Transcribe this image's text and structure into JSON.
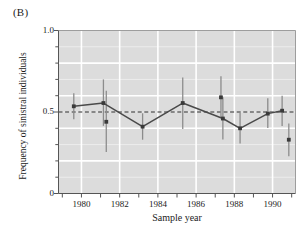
{
  "panel": {
    "label": "(B)"
  },
  "chart_data": {
    "type": "scatter",
    "title": "",
    "xlabel": "Sample year",
    "ylabel": "Frequency of sinistral individuals",
    "xlim": [
      1978.8,
      1991.2
    ],
    "ylim": [
      0.0,
      1.0
    ],
    "grid": true,
    "grid_color": "#ffffff",
    "plot_bg": "#dcdcdc",
    "legend": "none",
    "series_color": "#4a4a4a",
    "marker_color": "#3a3a3a",
    "errorbar_color": "#8c8c8c",
    "xticks_major": [
      1980,
      1982,
      1984,
      1986,
      1988,
      1990
    ],
    "xticks_major_labels": [
      "1980",
      "1982",
      "1984",
      "1986",
      "1988",
      "1990"
    ],
    "xticks_minor": [
      1979,
      1981,
      1983,
      1985,
      1987,
      1989,
      1991
    ],
    "yticks_major": [
      0.0,
      0.5,
      1.0
    ],
    "yticks_major_labels": [
      "0",
      "0.5",
      "1.0"
    ],
    "yticks_minor": [
      0.1,
      0.2,
      0.3,
      0.4,
      0.6,
      0.7,
      0.8,
      0.9
    ],
    "reference_line": {
      "y": 0.5,
      "style": "dashed",
      "color": "#2b2b2b"
    },
    "connected": true,
    "points": [
      {
        "x": 1979.6,
        "y": 0.535,
        "lo": 0.455,
        "hi": 0.615,
        "connect": true
      },
      {
        "x": 1981.15,
        "y": 0.555,
        "lo": 0.415,
        "hi": 0.7,
        "connect": true
      },
      {
        "x": 1983.2,
        "y": 0.41,
        "lo": 0.33,
        "hi": 0.492,
        "connect": true
      },
      {
        "x": 1985.3,
        "y": 0.555,
        "lo": 0.395,
        "hi": 0.712,
        "connect": true
      },
      {
        "x": 1987.4,
        "y": 0.46,
        "lo": 0.332,
        "hi": 0.59,
        "connect": true
      },
      {
        "x": 1988.3,
        "y": 0.4,
        "lo": 0.307,
        "hi": 0.496,
        "connect": true
      },
      {
        "x": 1989.75,
        "y": 0.49,
        "lo": 0.402,
        "hi": 0.584,
        "connect": true
      },
      {
        "x": 1990.5,
        "y": 0.508,
        "lo": 0.414,
        "hi": 0.6,
        "connect": true
      }
    ],
    "extra_points": [
      {
        "x": 1981.3,
        "y": 0.44,
        "lo": 0.255,
        "hi": 0.63
      },
      {
        "x": 1987.3,
        "y": 0.59,
        "lo": 0.47,
        "hi": 0.72
      },
      {
        "x": 1990.85,
        "y": 0.33,
        "lo": 0.228,
        "hi": 0.43
      }
    ]
  }
}
